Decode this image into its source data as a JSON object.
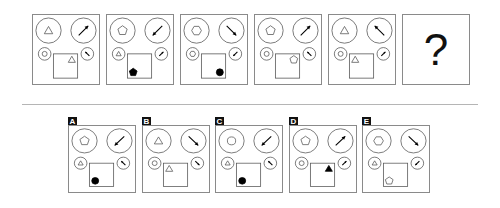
{
  "puzzle": {
    "question_mark": "?",
    "colors": {
      "stroke": "#555555",
      "fill_dark": "#000000",
      "border": "#8a8a8a",
      "divider": "#b5b5b5"
    },
    "sequence": [
      {
        "id": "s1",
        "big_left": "triangle",
        "arrow_big": "ne",
        "small_left": "circle",
        "arrow_small": "nw",
        "square_shape": "triangle",
        "square_filled": false,
        "square_pos": "top-right"
      },
      {
        "id": "s2",
        "big_left": "pentagon",
        "arrow_big": "sw",
        "small_left": "triangle",
        "arrow_small": "ne",
        "square_shape": "pentagon",
        "square_filled": true,
        "square_pos": "bottom-left"
      },
      {
        "id": "s3",
        "big_left": "hexagon",
        "arrow_big": "se",
        "small_left": "hexagon",
        "arrow_small": "sw",
        "square_shape": "circle",
        "square_filled": true,
        "square_pos": "bottom-right"
      },
      {
        "id": "s4",
        "big_left": "pentagon",
        "arrow_big": "ne",
        "small_left": "circle",
        "arrow_small": "nw",
        "square_shape": "pentagon",
        "square_filled": false,
        "square_pos": "top-right"
      },
      {
        "id": "s5",
        "big_left": "triangle",
        "arrow_big": "nw",
        "small_left": "circle",
        "arrow_small": "ne",
        "square_shape": "triangle",
        "square_filled": false,
        "square_pos": "top-left"
      }
    ],
    "options": [
      {
        "label": "A",
        "big_left": "pentagon",
        "arrow_big": "sw",
        "small_left": "triangle",
        "arrow_small": "nw",
        "square_shape": "circle",
        "square_filled": true,
        "square_pos": "bottom-left"
      },
      {
        "label": "B",
        "big_left": "triangle",
        "arrow_big": "se",
        "small_left": "circle",
        "arrow_small": "se",
        "square_shape": "triangle",
        "square_filled": false,
        "square_pos": "top-left"
      },
      {
        "label": "C",
        "big_left": "circle",
        "arrow_big": "sw",
        "small_left": "triangle",
        "arrow_small": "nw",
        "square_shape": "circle",
        "square_filled": true,
        "square_pos": "bottom-left"
      },
      {
        "label": "D",
        "big_left": "pentagon",
        "arrow_big": "ne",
        "small_left": "circle",
        "arrow_small": "ne",
        "square_shape": "triangle",
        "square_filled": true,
        "square_pos": "top-right"
      },
      {
        "label": "E",
        "big_left": "hexagon",
        "arrow_big": "se",
        "small_left": "triangle",
        "arrow_small": "sw",
        "square_shape": "pentagon",
        "square_filled": false,
        "square_pos": "bottom-left"
      }
    ]
  }
}
